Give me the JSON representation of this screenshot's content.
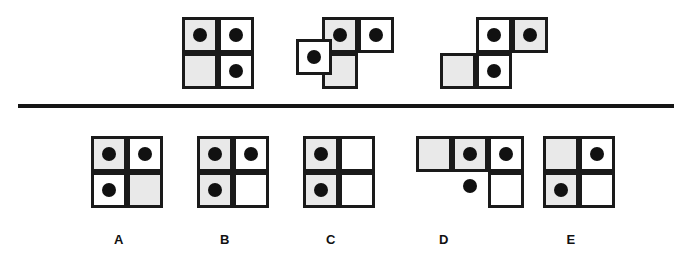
{
  "puzzle": {
    "type": "visual-analogy-matrix",
    "colors": {
      "cell_stroke": "#1a1a1a",
      "cell_gray_fill": "#e9e9e9",
      "cell_white_fill": "#ffffff",
      "dot": "#111111",
      "divider": "#151515",
      "background": "#ffffff"
    },
    "geometry": {
      "cell_size": 36,
      "dot_diameter": 14,
      "divider": {
        "x": 18,
        "y": 104,
        "width": 656,
        "height": 4
      }
    },
    "prompt_row": {
      "label": "",
      "figures": [
        {
          "name": "prompt-figure-1",
          "origin": {
            "x": 182,
            "y": 17
          },
          "cells": [
            {
              "name": "cell-top-left",
              "x": 0,
              "y": 0,
              "fill": "gray",
              "dot": true
            },
            {
              "name": "cell-top-right",
              "x": 36,
              "y": 0,
              "fill": "white",
              "dot": true
            },
            {
              "name": "cell-bottom-left",
              "x": 0,
              "y": 36,
              "fill": "gray",
              "dot": false
            },
            {
              "name": "cell-bottom-right",
              "x": 36,
              "y": 36,
              "fill": "white",
              "dot": true
            }
          ],
          "loose_dots": []
        },
        {
          "name": "prompt-figure-2",
          "origin": {
            "x": 296,
            "y": 17
          },
          "cells": [
            {
              "name": "cell-top-middle",
              "x": 26,
              "y": 0,
              "fill": "gray",
              "dot": true
            },
            {
              "name": "cell-top-right",
              "x": 62,
              "y": 0,
              "fill": "white",
              "dot": true
            },
            {
              "name": "cell-bottom-middle",
              "x": 26,
              "y": 36,
              "fill": "gray",
              "dot": false
            },
            {
              "name": "cell-detached-left",
              "x": 0,
              "y": 22,
              "fill": "white",
              "dot": true
            }
          ],
          "loose_dots": []
        },
        {
          "name": "prompt-figure-3",
          "origin": {
            "x": 440,
            "y": 17
          },
          "cells": [
            {
              "name": "cell-top-middle",
              "x": 36,
              "y": 0,
              "fill": "white",
              "dot": true
            },
            {
              "name": "cell-top-right",
              "x": 72,
              "y": 0,
              "fill": "gray",
              "dot": true
            },
            {
              "name": "cell-bottom-left",
              "x": 0,
              "y": 36,
              "fill": "gray",
              "dot": false
            },
            {
              "name": "cell-bottom-middle",
              "x": 36,
              "y": 36,
              "fill": "white",
              "dot": true
            }
          ],
          "loose_dots": []
        }
      ]
    },
    "answer_row": {
      "options": [
        {
          "name": "option-a",
          "letter": "A",
          "letter_x": 99,
          "origin": {
            "x": 91,
            "y": 136
          },
          "cells": [
            {
              "name": "cell-top-left",
              "x": 0,
              "y": 0,
              "fill": "gray",
              "dot": true
            },
            {
              "name": "cell-top-right",
              "x": 36,
              "y": 0,
              "fill": "white",
              "dot": true
            },
            {
              "name": "cell-bottom-left",
              "x": 0,
              "y": 36,
              "fill": "white",
              "dot": true
            },
            {
              "name": "cell-bottom-right",
              "x": 36,
              "y": 36,
              "fill": "gray",
              "dot": false
            }
          ],
          "loose_dots": []
        },
        {
          "name": "option-b",
          "letter": "B",
          "letter_x": 205,
          "origin": {
            "x": 197,
            "y": 136
          },
          "cells": [
            {
              "name": "cell-top-left",
              "x": 0,
              "y": 0,
              "fill": "gray",
              "dot": true
            },
            {
              "name": "cell-top-right",
              "x": 36,
              "y": 0,
              "fill": "white",
              "dot": true
            },
            {
              "name": "cell-bottom-left",
              "x": 0,
              "y": 36,
              "fill": "gray",
              "dot": true
            },
            {
              "name": "cell-bottom-right",
              "x": 36,
              "y": 36,
              "fill": "white",
              "dot": false
            }
          ],
          "loose_dots": []
        },
        {
          "name": "option-c",
          "letter": "C",
          "letter_x": 311,
          "origin": {
            "x": 303,
            "y": 136
          },
          "cells": [
            {
              "name": "cell-top-left",
              "x": 0,
              "y": 0,
              "fill": "gray",
              "dot": true
            },
            {
              "name": "cell-top-right",
              "x": 36,
              "y": 0,
              "fill": "white",
              "dot": false
            },
            {
              "name": "cell-bottom-left",
              "x": 0,
              "y": 36,
              "fill": "gray",
              "dot": true
            },
            {
              "name": "cell-bottom-right",
              "x": 36,
              "y": 36,
              "fill": "white",
              "dot": false
            }
          ],
          "loose_dots": []
        },
        {
          "name": "option-d",
          "letter": "D",
          "letter_x": 424,
          "origin": {
            "x": 416,
            "y": 136
          },
          "cells": [
            {
              "name": "cell-top-left",
              "x": 0,
              "y": 0,
              "fill": "gray",
              "dot": false
            },
            {
              "name": "cell-top-middle",
              "x": 36,
              "y": 0,
              "fill": "gray",
              "dot": true
            },
            {
              "name": "cell-top-right",
              "x": 72,
              "y": 0,
              "fill": "white",
              "dot": true
            },
            {
              "name": "cell-bottom-right",
              "x": 72,
              "y": 36,
              "fill": "white",
              "dot": false
            }
          ],
          "loose_dots": [
            {
              "name": "loose-dot-below-middle",
              "x": 47,
              "y": 43
            }
          ]
        },
        {
          "name": "option-e",
          "letter": "E",
          "letter_x": 551,
          "origin": {
            "x": 543,
            "y": 136
          },
          "cells": [
            {
              "name": "cell-top-left",
              "x": 0,
              "y": 0,
              "fill": "gray",
              "dot": false
            },
            {
              "name": "cell-top-right",
              "x": 36,
              "y": 0,
              "fill": "white",
              "dot": true
            },
            {
              "name": "cell-bottom-left",
              "x": 0,
              "y": 36,
              "fill": "gray",
              "dot": true
            },
            {
              "name": "cell-bottom-right",
              "x": 36,
              "y": 36,
              "fill": "white",
              "dot": false
            }
          ],
          "loose_dots": []
        }
      ]
    }
  }
}
